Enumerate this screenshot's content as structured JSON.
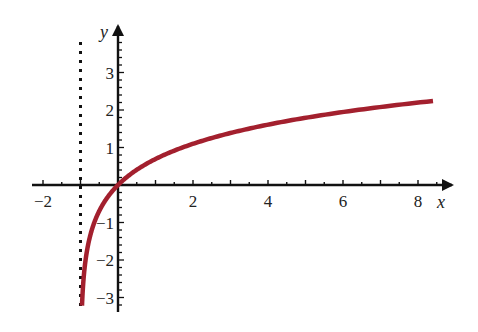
{
  "chart_data": {
    "type": "line",
    "title": "",
    "function": "y = ln(x + 1)",
    "xlabel": "x",
    "ylabel": "y",
    "xlim": [
      -2.2,
      8.9
    ],
    "ylim": [
      -3.2,
      4.2
    ],
    "x_ticks": [
      -2,
      2,
      4,
      6,
      8
    ],
    "x_tick_labels": [
      "−2",
      "2",
      "4",
      "6",
      "8"
    ],
    "y_ticks": [
      -3,
      -2,
      -1,
      1,
      2,
      3
    ],
    "y_tick_labels": [
      "−3",
      "−2",
      "−1",
      "1",
      "2",
      "3"
    ],
    "x_minor_step": 0.5,
    "y_minor_step": 0.2,
    "grid": false,
    "legend": null,
    "asymptote": {
      "x": -1,
      "style": "dotted"
    },
    "series": [
      {
        "name": "ln(x+1)",
        "color": "#a3202e",
        "x": [
          -0.96,
          -0.9,
          -0.8,
          -0.6,
          -0.4,
          -0.2,
          0,
          0.5,
          1,
          2,
          3,
          4,
          5,
          6,
          7,
          8,
          8.4
        ],
        "y": [
          -3.22,
          -2.3,
          -1.61,
          -0.92,
          -0.51,
          -0.22,
          0,
          0.41,
          0.69,
          1.1,
          1.39,
          1.61,
          1.79,
          1.95,
          2.08,
          2.2,
          2.24
        ]
      }
    ]
  },
  "colors": {
    "axis": "#111111",
    "curve": "#a3202e"
  }
}
